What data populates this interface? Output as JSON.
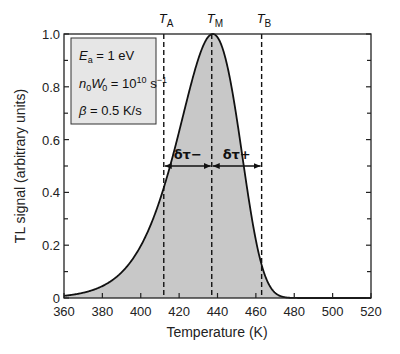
{
  "chart_data": {
    "type": "area",
    "title": "",
    "xlabel": "Temperature  (K)",
    "ylabel": "TL signal (arbitrary units)",
    "xlim": [
      360,
      520
    ],
    "ylim": [
      0,
      1.0
    ],
    "x_ticks": [
      360,
      380,
      400,
      420,
      440,
      460,
      480,
      500,
      520
    ],
    "x_tick_labels": [
      "360",
      "380",
      "400",
      "420",
      "440",
      "460",
      "480",
      "500",
      "520"
    ],
    "y_ticks": [
      0,
      0.2,
      0.4,
      0.6,
      0.8,
      1.0
    ],
    "y_tick_labels": [
      "0",
      "0.2",
      "0.4",
      "0.6",
      "0.8",
      "1.0"
    ],
    "grid": false,
    "legend": null,
    "series": [
      {
        "name": "TL glow curve (first-order)",
        "model": "Randall-Wilkins first order",
        "x": [
          360,
          370,
          380,
          390,
          400,
          405,
          410,
          412,
          415,
          420,
          425,
          430,
          435,
          437,
          440,
          445,
          450,
          455,
          460,
          463,
          465,
          470,
          480,
          490,
          500,
          510,
          520
        ],
        "values": [
          0.02,
          0.05,
          0.1,
          0.19,
          0.33,
          0.41,
          0.47,
          0.5,
          0.56,
          0.68,
          0.81,
          0.92,
          0.99,
          1.0,
          0.99,
          0.94,
          0.83,
          0.69,
          0.56,
          0.5,
          0.45,
          0.35,
          0.2,
          0.1,
          0.05,
          0.025,
          0.01
        ]
      }
    ],
    "annotations": {
      "params_box": {
        "line1": {
          "sym": "E",
          "sub": "a",
          "rest": " = 1 eV"
        },
        "line2": {
          "pre": "n",
          "pre_sub": "0",
          "sym": "W",
          "sym_sup": "′",
          "sym_sub": "0",
          "rest": " = 10",
          "exp": "10",
          "unit": " s",
          "unit_exp": "−1"
        },
        "line3": {
          "sym": "β",
          "rest": " = 0.5 K/s"
        }
      },
      "markers": [
        {
          "label": "T",
          "sub": "A",
          "x": 412
        },
        {
          "label": "T",
          "sub": "M",
          "x": 437
        },
        {
          "label": "T",
          "sub": "B",
          "x": 463
        }
      ],
      "half_width_y": 0.5,
      "delta_minus": "δτ−",
      "delta_plus": "δτ+"
    },
    "fill_color": "#c8c8c8",
    "line_color": "#111111"
  }
}
